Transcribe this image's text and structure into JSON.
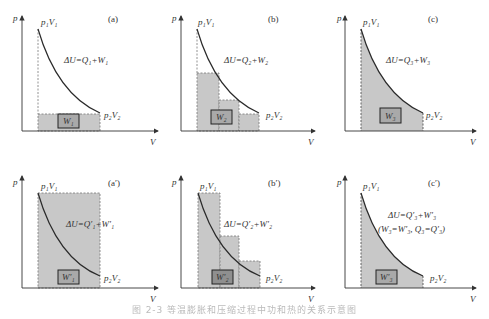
{
  "colors": {
    "fill": "#c8c8c8",
    "w_box": "#a9a9a9",
    "axis": "#333333",
    "curve": "#2a2a2a",
    "dash": "#777777"
  },
  "axes": {
    "y_label": "p",
    "x_label": "V"
  },
  "points": {
    "start": "p₁V₁",
    "end": "p₂V₂"
  },
  "panels": [
    {
      "id": "a",
      "tag": "(a)",
      "equation": "ΔU=Q₁+W₁",
      "work_label": "W₁",
      "mode": "single-step-low"
    },
    {
      "id": "b",
      "tag": "(b)",
      "equation": "ΔU=Q₂+W₂",
      "work_label": "W₂",
      "mode": "three-steps-low"
    },
    {
      "id": "c",
      "tag": "(c)",
      "equation": "ΔU=Q₃+W₃",
      "work_label": "W₃",
      "mode": "under-curve"
    },
    {
      "id": "a_prime",
      "tag": "(a′)",
      "equation": "ΔU=Q′₁+W′₁",
      "work_label": "W′₁",
      "mode": "single-step-high"
    },
    {
      "id": "b_prime",
      "tag": "(b′)",
      "equation": "ΔU=Q′₂+W′₂",
      "work_label": "W′₂",
      "mode": "three-steps-high"
    },
    {
      "id": "c_prime",
      "tag": "(c′)",
      "equation": "ΔU=Q′₃+W′₃",
      "note": "(W₃=W′₃, Q₃=Q′₃)",
      "work_label": "W′₃",
      "mode": "under-curve"
    }
  ],
  "caption": "图 2-3  等温膨胀和压缩过程中功和热的关系示意图"
}
